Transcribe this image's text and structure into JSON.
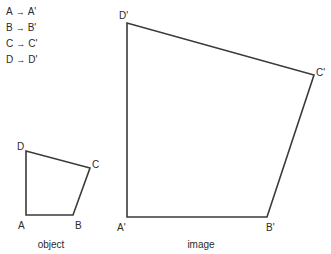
{
  "legend": {
    "mappings": [
      {
        "from": "A",
        "arrow": "→",
        "to": "A'"
      },
      {
        "from": "B",
        "arrow": "→",
        "to": "B'"
      },
      {
        "from": "C",
        "arrow": "→",
        "to": "C'"
      },
      {
        "from": "D",
        "arrow": "→",
        "to": "D'"
      }
    ]
  },
  "object": {
    "caption": "object",
    "vertices": {
      "A": {
        "label": "A",
        "x": 26,
        "y": 215
      },
      "B": {
        "label": "B",
        "x": 73,
        "y": 215
      },
      "C": {
        "label": "C",
        "x": 90,
        "y": 168
      },
      "D": {
        "label": "D",
        "x": 26,
        "y": 151
      }
    }
  },
  "image": {
    "caption": "image",
    "vertices": {
      "A": {
        "label": "A'",
        "x": 127,
        "y": 217
      },
      "B": {
        "label": "B'",
        "x": 267,
        "y": 217
      },
      "C": {
        "label": "C'",
        "x": 314,
        "y": 75
      },
      "D": {
        "label": "D'",
        "x": 127,
        "y": 23
      }
    }
  },
  "colors": {
    "stroke": "#3a3a3a",
    "text": "#2a2a2a",
    "background": "#ffffff"
  }
}
